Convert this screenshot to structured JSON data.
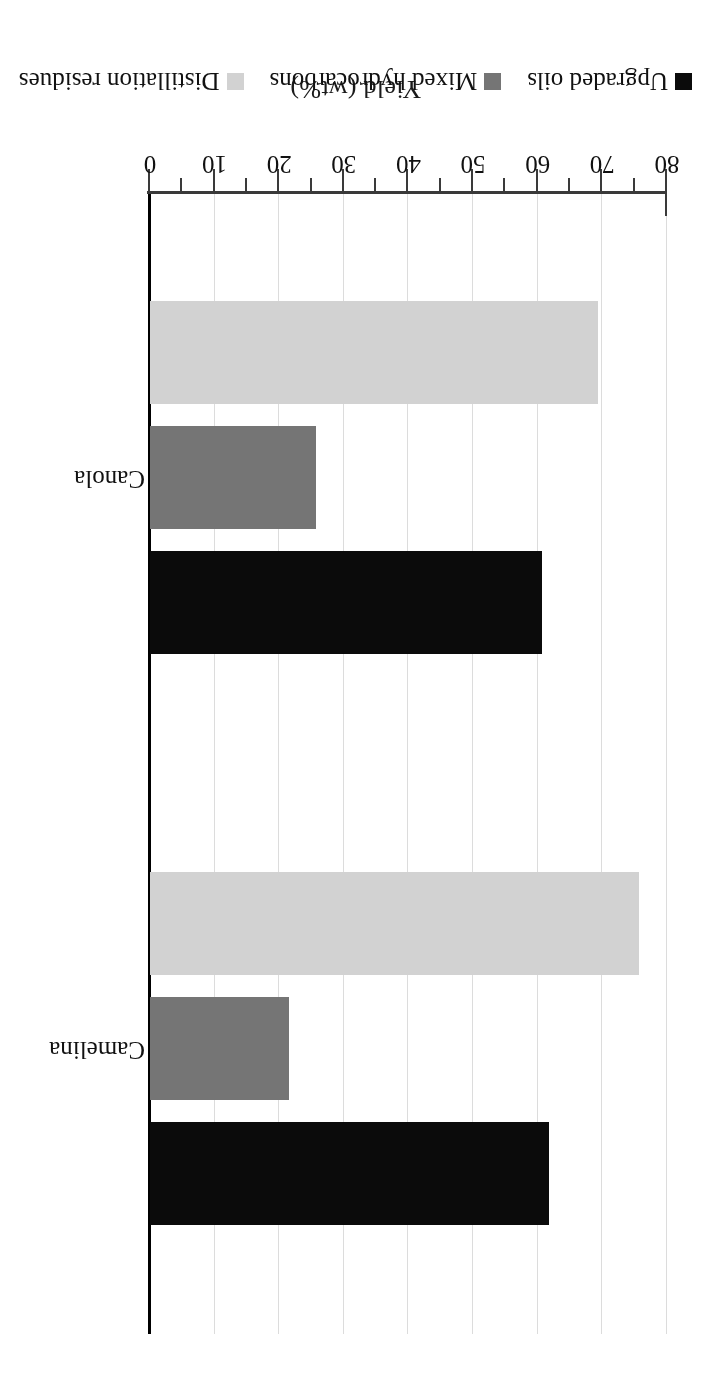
{
  "chart_data": {
    "type": "bar",
    "orientation": "horizontal",
    "title": "",
    "xlabel": "Yield (wt%)",
    "ylabel": "",
    "categories": [
      "Camelina",
      "Canola"
    ],
    "series": [
      {
        "name": "Upgraded oils",
        "color": "#0b0b0b",
        "values": [
          61.7,
          60.7
        ]
      },
      {
        "name": "Mixed hydrocarbons",
        "color": "#757575",
        "values": [
          21.5,
          25.7
        ]
      },
      {
        "name": "Distillation residues",
        "color": "#d2d2d2",
        "values": [
          75.7,
          69.4
        ]
      }
    ],
    "xlim": [
      0,
      80
    ],
    "xticks": [
      0,
      10,
      20,
      30,
      40,
      50,
      60,
      70,
      80
    ],
    "xtick_labels": [
      "0",
      "10",
      "20",
      "30",
      "40",
      "50",
      "60",
      "70",
      "80"
    ],
    "minor_ticks": true,
    "grid": true,
    "grid_axis": "value",
    "legend_position": "bottom",
    "rotated_180": true
  },
  "axis": {
    "value_axis_title": "Yield (wt%)"
  },
  "legend": {
    "items": [
      {
        "label": "Upgraded oils",
        "color": "#0b0b0b"
      },
      {
        "label": "Mixed hydrocarbons",
        "color": "#757575"
      },
      {
        "label": "Distillation residues",
        "color": "#d2d2d2"
      }
    ]
  }
}
